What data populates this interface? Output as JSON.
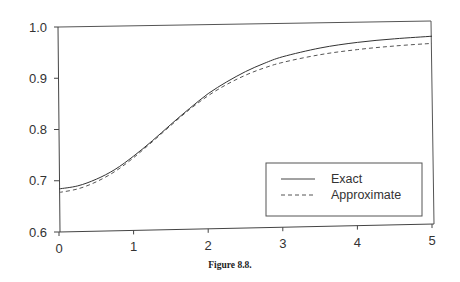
{
  "chart_data": {
    "type": "line",
    "title": "",
    "caption": "Figure 8.8.",
    "xlabel": "",
    "ylabel": "",
    "xlim": [
      0,
      5
    ],
    "ylim": [
      0.6,
      1.0
    ],
    "x_ticks": [
      "0",
      "1",
      "2",
      "3",
      "4",
      "5"
    ],
    "y_ticks": [
      "0.6",
      "0.7",
      "0.8",
      "0.9",
      "1.0"
    ],
    "grid": false,
    "legend_position": "lower right",
    "x": [
      0,
      0.25,
      0.5,
      0.75,
      1.0,
      1.25,
      1.5,
      1.75,
      2.0,
      2.25,
      2.5,
      2.75,
      3.0,
      3.5,
      4.0,
      4.5,
      5.0
    ],
    "series": [
      {
        "name": "Exact",
        "style": "solid",
        "values": [
          0.684,
          0.69,
          0.703,
          0.722,
          0.748,
          0.778,
          0.81,
          0.841,
          0.87,
          0.893,
          0.913,
          0.929,
          0.942,
          0.959,
          0.97,
          0.977,
          0.982
        ]
      },
      {
        "name": "Approximate",
        "style": "dashed",
        "values": [
          0.677,
          0.684,
          0.698,
          0.718,
          0.745,
          0.776,
          0.808,
          0.839,
          0.866,
          0.888,
          0.906,
          0.92,
          0.931,
          0.946,
          0.956,
          0.963,
          0.968
        ]
      }
    ]
  },
  "legend": {
    "items": [
      {
        "label": "Exact"
      },
      {
        "label": "Approximate"
      }
    ]
  },
  "figure": {
    "caption": "Figure 8.8."
  }
}
